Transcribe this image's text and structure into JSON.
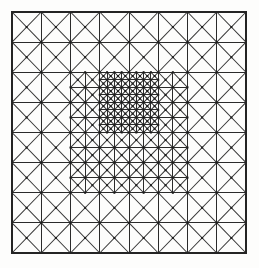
{
  "figure": {
    "name": "adaptive-triangular-mesh",
    "title": "",
    "caption": "",
    "background_color": "#fdfdfc",
    "line_color": "#2b2b2b",
    "node_color": "#1c1c1c",
    "boundary_color": "#242424"
  },
  "chart_data": {
    "type": "diagram",
    "title": "",
    "xlabel": "",
    "ylabel": "",
    "grid": true,
    "legend": "none",
    "domain": {
      "x0": 12,
      "y0": 12,
      "x1": 246,
      "y1": 253,
      "width": 234,
      "height": 241
    },
    "base_grid": {
      "columns": 8,
      "rows": 8,
      "cell_width": 29.25,
      "cell_height": 30.125
    },
    "refinement_levels": [
      {
        "level": 0,
        "label": "base cell",
        "cells": 64,
        "divisions": 1
      },
      {
        "level": 1,
        "label": "once refined",
        "cells": 16,
        "divisions": 2
      },
      {
        "level": 2,
        "label": "twice refined",
        "cells": 4,
        "divisions": 4
      }
    ],
    "refinement_regions": [
      {
        "level": 1,
        "col_start": 2,
        "col_end": 6,
        "row_start": 2,
        "row_end": 6
      },
      {
        "level": 2,
        "col_start": 3,
        "col_end": 5,
        "row_start": 2,
        "row_end": 4
      }
    ],
    "cell_pattern": "each quadrilateral cell is split into four triangles by both diagonals through the cell centre",
    "node_marker": {
      "shape": "square",
      "size_px": 2
    },
    "counts": {
      "outer_boundary_segments": 4,
      "vertical_grid_lines": 9,
      "horizontal_grid_lines": 9
    }
  }
}
